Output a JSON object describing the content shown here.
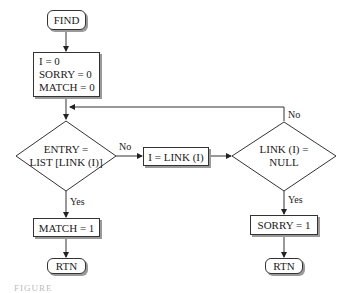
{
  "diagram": {
    "type": "flowchart",
    "nodes": {
      "start": {
        "label": "FIND",
        "shape": "terminal"
      },
      "init": {
        "lines": [
          "I = 0",
          "SORRY = 0",
          "MATCH = 0"
        ],
        "shape": "process"
      },
      "decision_entry": {
        "lines": [
          "ENTRY =",
          "LIST [LINK (I)]"
        ],
        "shape": "decision"
      },
      "advance": {
        "label": "I = LINK (I)",
        "shape": "process"
      },
      "decision_null": {
        "lines": [
          "LINK (I) =",
          "NULL"
        ],
        "shape": "decision"
      },
      "match_set": {
        "label": "MATCH = 1",
        "shape": "process"
      },
      "sorry_set": {
        "label": "SORRY = 1",
        "shape": "process"
      },
      "return_left": {
        "label": "RTN",
        "shape": "terminal"
      },
      "return_right": {
        "label": "RTN",
        "shape": "terminal"
      }
    },
    "edge_labels": {
      "entry_no": "No",
      "entry_yes": "Yes",
      "null_no": "No",
      "null_yes": "Yes"
    },
    "caption": "FIGURE"
  }
}
